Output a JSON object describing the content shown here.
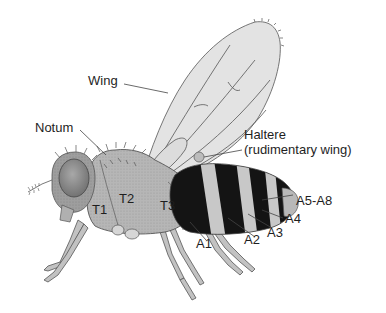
{
  "diagram": {
    "colors": {
      "body_gray": "#b4b4b4",
      "body_dark": "#8c8c8c",
      "eye": "#8a8a8a",
      "wing_fill": "#e2e2e2",
      "band_black": "#141414",
      "band_light": "#c8c8c8",
      "leader_line": "#444444"
    },
    "labels": {
      "wing": "Wing",
      "notum": "Notum",
      "haltere_1": "Haltere",
      "haltere_2": "(rudimentary wing)",
      "t1": "T1",
      "t2": "T2",
      "t3": "T3",
      "a1": "A1",
      "a2": "A2",
      "a3": "A3",
      "a4": "A4",
      "a5_a8": "A5-A8"
    }
  }
}
